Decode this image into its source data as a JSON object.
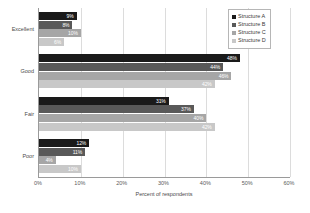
{
  "chart_data": {
    "type": "bar",
    "orientation": "horizontal",
    "title": "",
    "xlabel": "Percent of respondents",
    "ylabel": "",
    "categories": [
      "Excellent",
      "Good",
      "Fair",
      "Poor"
    ],
    "xlim": [
      0,
      60
    ],
    "xticks": [
      0,
      10,
      20,
      30,
      40,
      50,
      60
    ],
    "xtick_labels": [
      "0%",
      "10%",
      "20%",
      "30%",
      "40%",
      "50%",
      "60%"
    ],
    "grid": true,
    "grid_axis": "x",
    "legend_position": "top-right",
    "value_suffix": "%",
    "series": [
      {
        "name": "Structure A",
        "color": "#1a1a1a",
        "values": [
          9,
          48,
          31,
          12
        ],
        "value_labels": [
          "9%",
          "48%",
          "31%",
          "12%"
        ]
      },
      {
        "name": "Structure B",
        "color": "#595959",
        "values": [
          8,
          44,
          37,
          11
        ],
        "value_labels": [
          "8%",
          "44%",
          "37%",
          "11%"
        ]
      },
      {
        "name": "Structure C",
        "color": "#a6a6a6",
        "values": [
          10,
          46,
          40,
          4
        ],
        "value_labels": [
          "10%",
          "46%",
          "40%",
          "4%"
        ]
      },
      {
        "name": "Structure D",
        "color": "#c8c8c8",
        "values": [
          6,
          42,
          42,
          10
        ],
        "value_labels": [
          "6%",
          "42%",
          "42%",
          "10%"
        ]
      }
    ]
  },
  "colors": {
    "series_a": "#1a1a1a",
    "series_b": "#595959",
    "series_c": "#a6a6a6",
    "series_d": "#c8c8c8",
    "axis": "#9a9a9a",
    "grid": "#dcdcdc",
    "text": "#4a4a4a",
    "value_label": "#ffffff",
    "background": "#ffffff"
  }
}
